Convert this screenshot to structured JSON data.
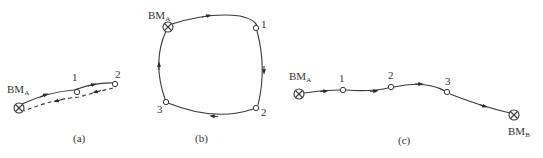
{
  "diagrams": {
    "a": {
      "caption": "(a)",
      "start": {
        "label": "BM",
        "sub": "A"
      },
      "points": [
        "1",
        "2"
      ],
      "route_type": "spur (out-and-back)"
    },
    "b": {
      "caption": "(b)",
      "start": {
        "label": "BM",
        "sub": "A"
      },
      "points": [
        "1",
        "2",
        "3"
      ],
      "route_type": "closed loop"
    },
    "c": {
      "caption": "(c)",
      "start": {
        "label": "BM",
        "sub": "A"
      },
      "end": {
        "label": "BM",
        "sub": "B"
      },
      "points": [
        "1",
        "2",
        "3"
      ],
      "route_type": "attached (connecting)"
    }
  },
  "colors": {
    "line": "#3a3a3a",
    "text": "#333333",
    "background": "#ffffff"
  }
}
